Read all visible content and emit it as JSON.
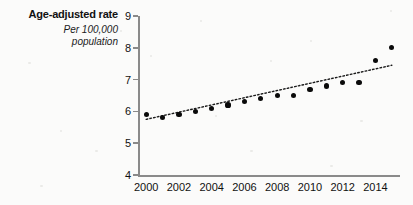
{
  "title": "Age-adjusted rate",
  "subtitle_line1": "Per 100,000",
  "subtitle_line2": "population",
  "chart_data": {
    "type": "scatter",
    "title": "Age-adjusted rate",
    "subtitle": "Per 100,000 population",
    "xlabel": "",
    "ylabel": "Age-adjusted rate per 100,000 population",
    "xlim": [
      1999.5,
      2015.5
    ],
    "ylim": [
      4,
      9
    ],
    "grid": false,
    "legend": null,
    "y_ticks": [
      9,
      8,
      7,
      6,
      5,
      4
    ],
    "y_tick_labels": [
      "9",
      "8",
      "7",
      "6",
      "5",
      "4"
    ],
    "x_ticks": [
      2000,
      2002,
      2004,
      2006,
      2008,
      2010,
      2012,
      2014
    ],
    "x_tick_labels": [
      "2000",
      "2002",
      "2004",
      "2006",
      "2008",
      "2010",
      "2012",
      "2014"
    ],
    "x": [
      2000,
      2001,
      2002,
      2003,
      2004,
      2005,
      2006,
      2007,
      2008,
      2009,
      2010,
      2011,
      2012,
      2013,
      2014,
      2015
    ],
    "values": [
      5.9,
      5.8,
      5.9,
      6.0,
      6.1,
      6.2,
      6.3,
      6.4,
      6.5,
      6.5,
      6.7,
      6.8,
      6.9,
      6.9,
      7.6,
      8.0
    ],
    "series": [
      {
        "name": "Age-adjusted rate",
        "marker": "filled-circle",
        "color": "#0a0a0a",
        "values": [
          5.9,
          5.8,
          5.9,
          6.0,
          6.1,
          6.2,
          6.3,
          6.4,
          6.5,
          6.5,
          6.7,
          6.8,
          6.9,
          6.9,
          7.6,
          8.0
        ]
      }
    ],
    "trend_line": {
      "name": "linear trend",
      "style": "dotted",
      "color": "#1a1a1a",
      "x_start": 2000,
      "y_start": 5.75,
      "x_end": 2015,
      "y_end": 7.45
    }
  }
}
